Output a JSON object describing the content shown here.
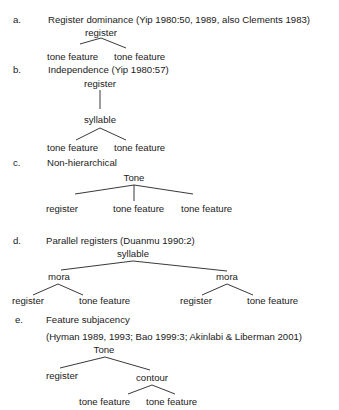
{
  "examples": [
    {
      "label": "a.",
      "title": "Register dominance (Yip 1980:50, 1989, also Clements 1983)",
      "nodes": {
        "root": "register",
        "leaf1": "tone feature",
        "leaf2": "tone feature"
      }
    },
    {
      "label": "b.",
      "title": "Independence (Yip 1980:57)",
      "nodes": {
        "root": "register",
        "mid": "syllable",
        "leaf1": "tone feature",
        "leaf2": "tone feature"
      }
    },
    {
      "label": "c.",
      "title": "Non-hierarchical",
      "nodes": {
        "root": "Tone",
        "leaf1": "register",
        "leaf2": "tone feature",
        "leaf3": "tone feature"
      }
    },
    {
      "label": "d.",
      "title": "Parallel registers (Duanmu 1990:2)",
      "nodes": {
        "root": "syllable",
        "mora1": "mora",
        "mora2": "mora",
        "leaf1": "register",
        "leaf2": "tone feature",
        "leaf3": "register",
        "leaf4": "tone feature"
      }
    },
    {
      "label": "e.",
      "title": "Feature subjacency",
      "citation": "(Hyman 1989, 1993; Bao 1999:3; Akinlabi & Liberman 2001)",
      "nodes": {
        "root": "Tone",
        "left": "register",
        "mid": "contour",
        "leaf1": "tone feature",
        "leaf2": "tone feature"
      }
    }
  ]
}
